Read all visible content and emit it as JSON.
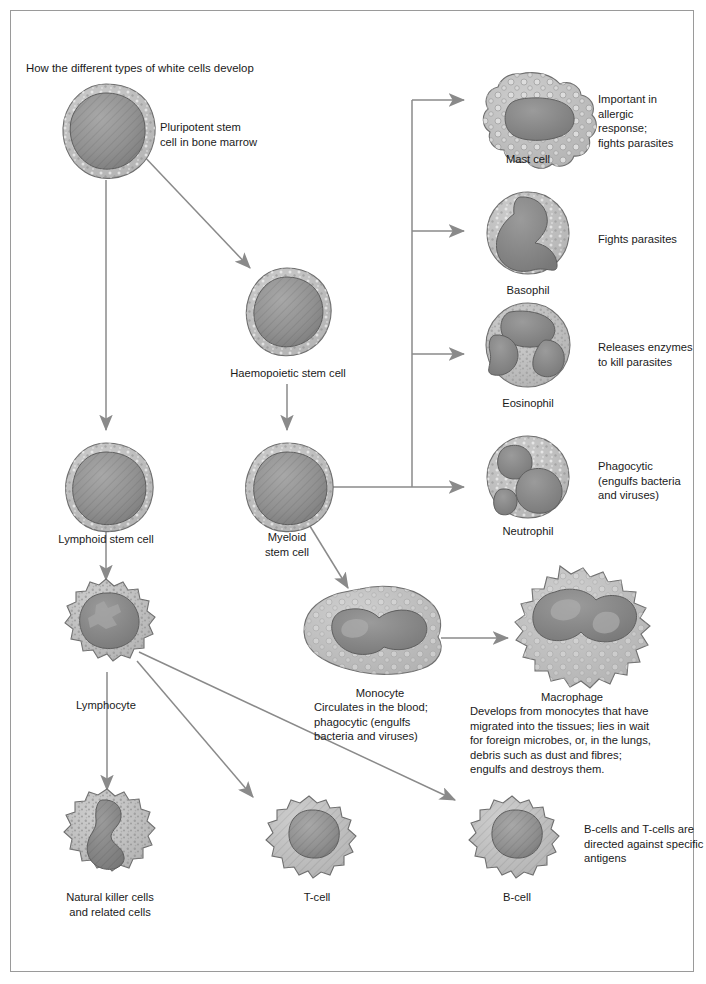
{
  "title": "How the different types of white cells develop",
  "cells": {
    "pluripotent": {
      "label": "Pluripotent stem\ncell in bone marrow",
      "kind": "granular-round"
    },
    "haemopoietic": {
      "label": "Haemopoietic stem cell",
      "kind": "granular-round"
    },
    "lymphoid": {
      "label": "Lymphoid stem cell",
      "kind": "granular-round"
    },
    "myeloid": {
      "label": "Myeloid\nstem cell",
      "kind": "granular-round"
    },
    "lymphocyte": {
      "label": "Lymphocyte",
      "kind": "spiky-granular"
    },
    "mast": {
      "label": "Mast cell",
      "desc": "Important in\nallergic\nresponse;\nfights parasites",
      "kind": "vacuolated-amoeboid"
    },
    "basophil": {
      "label": "Basophil",
      "desc": "Fights parasites",
      "kind": "round-lobed"
    },
    "eosinophil": {
      "label": "Eosinophil",
      "desc": "Releases enzymes\nto kill parasites",
      "kind": "round-bilobed"
    },
    "neutrophil": {
      "label": "Neutrophil",
      "desc": "Phagocytic\n(engulfs bacteria\nand viruses)",
      "kind": "round-multilobed"
    },
    "monocyte": {
      "label": "Monocyte",
      "desc": "Circulates in the blood;\nphagocytic (engulfs\nbacteria and viruses)",
      "kind": "amoeboid-kidney"
    },
    "macrophage": {
      "label": "Macrophage",
      "desc": "Develops from monocytes that have\nmigrated into the tissues; lies in wait\nfor foreign microbes, or, in the lungs,\ndebris such as dust and fibres;\nengulfs and destroys them.",
      "kind": "large-spiky-amoeboid"
    },
    "nk": {
      "label": "Natural killer cells\nand related cells",
      "kind": "spiky-granular"
    },
    "tcell": {
      "label": "T-cell",
      "kind": "spiky-smooth"
    },
    "bcell": {
      "label": "B-cell",
      "desc": "B-cells and T-cells are\ndirected against specific\nantigens",
      "kind": "spiky-smooth"
    }
  },
  "colors": {
    "cytoplasm": "#b9b9b9",
    "cytoplasm_light": "#c9c9c9",
    "nucleus": "#8f8f8f",
    "nucleus_dark": "#7d7d7d",
    "outline": "#6b6b6b",
    "arrow": "#808080",
    "border": "#9a9a9a",
    "text": "#1a1a1a"
  }
}
